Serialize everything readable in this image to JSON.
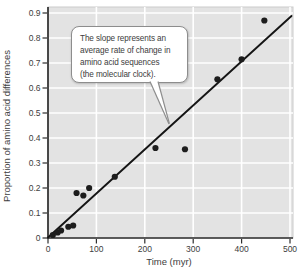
{
  "chart_data": {
    "type": "scatter",
    "title": "",
    "xlabel": "Time (myr)",
    "ylabel": "Proportion of amino acid differences",
    "xlim": [
      0,
      500
    ],
    "ylim": [
      0,
      0.9
    ],
    "x_ticks": [
      0,
      100,
      200,
      300,
      400,
      500
    ],
    "y_ticks": [
      "0",
      "0.1",
      "0.2",
      "0.3",
      "0.4",
      "0.5",
      "0.6",
      "0.7",
      "0.8",
      "0.9"
    ],
    "grid": true,
    "legend": "none",
    "points": [
      {
        "x": 10,
        "y": 0.012
      },
      {
        "x": 20,
        "y": 0.022
      },
      {
        "x": 27,
        "y": 0.03
      },
      {
        "x": 42,
        "y": 0.045
      },
      {
        "x": 52,
        "y": 0.05
      },
      {
        "x": 59,
        "y": 0.18
      },
      {
        "x": 73,
        "y": 0.17
      },
      {
        "x": 85,
        "y": 0.2
      },
      {
        "x": 138,
        "y": 0.245
      },
      {
        "x": 222,
        "y": 0.36
      },
      {
        "x": 283,
        "y": 0.355
      },
      {
        "x": 350,
        "y": 0.635
      },
      {
        "x": 400,
        "y": 0.715
      },
      {
        "x": 447,
        "y": 0.87
      }
    ],
    "trend_line": {
      "from": {
        "x": 0,
        "y": 0.002
      },
      "to": {
        "x": 503,
        "y": 0.888
      }
    },
    "annotation": {
      "lines": [
        "The slope represents an",
        "average rate of change in",
        "amino acid sequences",
        "(the molecular clock)."
      ]
    },
    "colors": {
      "plot_bg": "#e3e3e3",
      "plot_frame": "#cccccc",
      "gridline": "#ffffff",
      "axis": "#2e2e2e",
      "point": "#1d1d1d",
      "line": "#151515",
      "text": "#3d3d3d",
      "callout_bg": "#ffffff",
      "callout_border": "#8d8d8d"
    }
  }
}
